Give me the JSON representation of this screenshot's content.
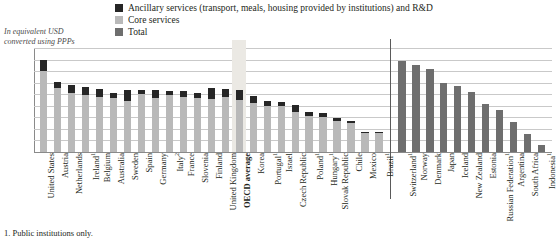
{
  "axis_caption": "In equivalent USD converted using PPPs",
  "footnote": "1. Public institutions only.",
  "legend": [
    {
      "key": "ancillary",
      "label": "Ancillary services (transport, meals, housing provided by institutions) and R&D",
      "color": "#262626"
    },
    {
      "key": "core",
      "label": "Core services",
      "color": "#b9b9b9"
    },
    {
      "key": "total",
      "label": "Total",
      "color": "#6e6e6e"
    }
  ],
  "colors": {
    "ancillary": "#262626",
    "core": "#b9b9b9",
    "total": "#6e6e6e",
    "highlight_band": "#ebe9e4",
    "grid": "#c9c9c9",
    "axis": "#8a8a8a"
  },
  "chart_data": {
    "type": "bar",
    "title": "",
    "subtitle": "",
    "xlabel": "",
    "ylabel": "In equivalent USD converted using PPPs",
    "ylim": [
      0,
      18000
    ],
    "ytick_step": 2000,
    "yticks": [
      "18 000",
      "16 000",
      "14 000",
      "12 000",
      "10 000",
      "8 000",
      "6 000",
      "4 000",
      "2 000",
      "0"
    ],
    "grid": true,
    "legend_position": "top",
    "stacked": true,
    "highlighted_category": "OECD average",
    "group_separator_after": "Brazil",
    "categories": [
      "United States",
      "Austria",
      "Netherlands",
      "Ireland",
      "Belgium",
      "Australia",
      "Sweden",
      "Spain",
      "Germany",
      "Italy",
      "France",
      "Slovenia",
      "Finland",
      "United Kingdom",
      "OECD average",
      "Korea",
      "Portugal",
      "Israel",
      "Czech Republic",
      "Poland",
      "Hungary",
      "Slovak Republic",
      "Chile",
      "Mexico",
      "Brazil",
      "Switzerland",
      "Norway",
      "Denmark",
      "Japan",
      "Iceland",
      "New Zealand",
      "Estonia",
      "Russian Federation",
      "Argentina",
      "South Africa",
      "Indonesia"
    ],
    "category_footnote_marks": {
      "Ireland": "1",
      "Italy": "2",
      "Portugal": "1",
      "Poland": "1",
      "Hungary": "1",
      "Brazil": "1",
      "Switzerland": "1",
      "Russian Federation": "1",
      "Indonesia": "1"
    },
    "series": [
      {
        "name": "Core services",
        "values": [
          14100,
          11000,
          10200,
          9900,
          9600,
          9400,
          8900,
          10000,
          9300,
          9900,
          9500,
          9300,
          9200,
          9500,
          9000,
          8500,
          8000,
          7900,
          6900,
          6300,
          6100,
          5400,
          5000,
          3300,
          3300,
          null,
          null,
          null,
          null,
          null,
          null,
          null,
          null,
          null,
          null,
          null
        ]
      },
      {
        "name": "Ancillary services (transport, meals, housing provided by institutions) and R&D",
        "values": [
          1900,
          1200,
          1400,
          1300,
          1300,
          900,
          1900,
          700,
          1500,
          700,
          1100,
          900,
          1900,
          1400,
          1700,
          1200,
          900,
          800,
          1300,
          700,
          700,
          500,
          300,
          200,
          200,
          null,
          null,
          null,
          null,
          null,
          null,
          null,
          null,
          null,
          null,
          null
        ]
      },
      {
        "name": "Total",
        "values": [
          null,
          null,
          null,
          null,
          null,
          null,
          null,
          null,
          null,
          null,
          null,
          null,
          null,
          null,
          null,
          null,
          null,
          null,
          null,
          null,
          null,
          null,
          null,
          null,
          null,
          15800,
          15100,
          14300,
          12000,
          11500,
          10400,
          8300,
          7300,
          5200,
          3200,
          1300
        ]
      }
    ]
  }
}
